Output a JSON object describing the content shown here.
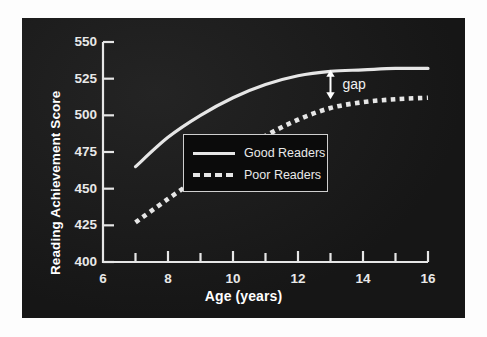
{
  "figure": {
    "background_color": "#ffffff",
    "panel_color": "#181818",
    "line_color": "#e6e6e6",
    "text_color": "#e8e8e8"
  },
  "annotations": {
    "gap_label": "gap",
    "gap_arrow_age": 13,
    "gap_arrow_top_value": 531,
    "gap_arrow_bottom_value": 511
  },
  "legend": {
    "position": "center-right",
    "entries": [
      {
        "label": "Good Readers",
        "style": "solid"
      },
      {
        "label": "Poor Readers",
        "style": "dashed"
      }
    ]
  },
  "chart_data": {
    "type": "line",
    "title": "",
    "subtitle": "",
    "xlabel": "Age (years)",
    "ylabel": "Reading Achievement Score",
    "xlim": [
      6,
      16
    ],
    "ylim": [
      400,
      550
    ],
    "xticks": [
      6,
      7,
      8,
      9,
      10,
      11,
      12,
      13,
      14,
      15,
      16
    ],
    "xtick_labels": [
      "6",
      "",
      "8",
      "",
      "10",
      "",
      "12",
      "",
      "14",
      "",
      "16"
    ],
    "xtick_major": [
      6,
      8,
      10,
      12,
      14,
      16
    ],
    "yticks": [
      400,
      425,
      450,
      475,
      500,
      525,
      550
    ],
    "ytick_labels": [
      "400",
      "425",
      "450",
      "475",
      "500",
      "525",
      "550"
    ],
    "grid": false,
    "x": [
      7,
      8,
      9,
      10,
      11,
      12,
      13,
      14,
      15,
      16
    ],
    "series": [
      {
        "name": "Good Readers",
        "style": "solid",
        "color": "#e6e6e6",
        "values": [
          465,
          485,
          500,
          512,
          521,
          527,
          530,
          531,
          532,
          532
        ]
      },
      {
        "name": "Poor Readers",
        "style": "dashed",
        "color": "#e6e6e6",
        "values": [
          427,
          443,
          458,
          472,
          486,
          497,
          505,
          509,
          511,
          512
        ]
      }
    ]
  }
}
